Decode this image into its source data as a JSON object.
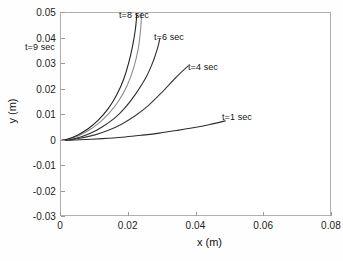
{
  "chart_data": {
    "type": "line",
    "title": "",
    "xlabel": "x (m)",
    "ylabel": "y (m)",
    "xlim": [
      0,
      0.08
    ],
    "ylim": [
      -0.03,
      0.05
    ],
    "xticks": [
      "0",
      "0.02",
      "0.04",
      "0.06",
      "0.08"
    ],
    "xtick_values": [
      0,
      0.02,
      0.04,
      0.06,
      0.08
    ],
    "yticks": [
      "0.05",
      "0.04",
      "0.03",
      "0.02",
      "0.01",
      "0",
      "-0.01",
      "-0.02",
      "-0.03"
    ],
    "ytick_values": [
      0.05,
      0.04,
      0.03,
      0.02,
      0.01,
      0,
      -0.01,
      -0.02,
      -0.03
    ],
    "grid": false,
    "legend": "inline-annotations",
    "background": "#ffffff",
    "axis_color": "#b0b0b0",
    "series": [
      {
        "name": "t=1 sec",
        "label": "t=1 sec",
        "color": "#2b2b2b",
        "x": [
          0,
          0.004,
          0.009,
          0.014,
          0.019,
          0.024,
          0.029,
          0.034,
          0.039,
          0.044,
          0.0485
        ],
        "y": [
          0,
          0.0002,
          0.0005,
          0.0009,
          0.0014,
          0.0021,
          0.0029,
          0.0039,
          0.005,
          0.0063,
          0.0077
        ]
      },
      {
        "name": "t=4 sec",
        "label": "t=4 sec",
        "color": "#3a3a3a",
        "x": [
          0,
          0.003,
          0.006,
          0.01,
          0.014,
          0.018,
          0.022,
          0.026,
          0.03,
          0.034,
          0.0375
        ],
        "y": [
          0,
          0.0003,
          0.001,
          0.0022,
          0.004,
          0.0065,
          0.0098,
          0.014,
          0.0192,
          0.0248,
          0.0292
        ]
      },
      {
        "name": "t=6 sec",
        "label": "t=6 sec",
        "color": "#2e2e2e",
        "x": [
          0,
          0.003,
          0.006,
          0.009,
          0.012,
          0.016,
          0.019,
          0.022,
          0.0252,
          0.0272,
          0.0285,
          0.0292
        ],
        "y": [
          0,
          0.0005,
          0.0015,
          0.003,
          0.0052,
          0.009,
          0.013,
          0.0182,
          0.025,
          0.031,
          0.0362,
          0.04
        ]
      },
      {
        "name": "t=8 sec",
        "label": "t=8 sec",
        "color": "#8c8c8c",
        "x": [
          0,
          0.002,
          0.005,
          0.008,
          0.011,
          0.014,
          0.017,
          0.0195,
          0.0215,
          0.0228,
          0.0235,
          0.0238
        ],
        "y": [
          0,
          0.0005,
          0.0018,
          0.0038,
          0.0066,
          0.0104,
          0.0155,
          0.0215,
          0.0287,
          0.036,
          0.0435,
          0.05
        ]
      },
      {
        "name": "t=9 sec",
        "label": "t=9 sec",
        "color": "#222222",
        "x": [
          0,
          0.002,
          0.005,
          0.008,
          0.011,
          0.014,
          0.0165,
          0.0185,
          0.02,
          0.0212,
          0.022,
          0.0224
        ],
        "y": [
          0,
          0.0006,
          0.0022,
          0.0046,
          0.008,
          0.0126,
          0.018,
          0.024,
          0.0305,
          0.0375,
          0.044,
          0.05
        ]
      }
    ],
    "annotations": [
      {
        "text": "t=9 sec",
        "x_px": 25,
        "y_px": 42
      },
      {
        "text": "t=8 sec",
        "x_px": 119,
        "y_px": 10
      },
      {
        "text": "t=6 sec",
        "x_px": 154,
        "y_px": 32
      },
      {
        "text": "t=4 sec",
        "x_px": 188,
        "y_px": 62
      },
      {
        "text": "t=1 sec",
        "x_px": 222,
        "y_px": 112
      }
    ]
  }
}
